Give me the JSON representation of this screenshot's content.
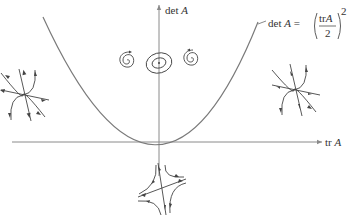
{
  "diagram": {
    "axes": {
      "horizontal_label": {
        "prefix": "tr",
        "var": "A"
      },
      "vertical_label": {
        "prefix": "det",
        "var": "A"
      }
    },
    "curve_label": {
      "lhs_prefix": "det",
      "lhs_var": "A",
      "equals": "=",
      "numerator_prefix": "tr",
      "numerator_var": "A",
      "denominator": "2",
      "exponent": "2"
    },
    "phase_portraits": [
      {
        "name": "node-unstable-left-region",
        "type": "node"
      },
      {
        "name": "spiral-left",
        "type": "spiral"
      },
      {
        "name": "center",
        "type": "center"
      },
      {
        "name": "spiral-right",
        "type": "spiral"
      },
      {
        "name": "node-right-region",
        "type": "node"
      },
      {
        "name": "saddle",
        "type": "saddle"
      }
    ],
    "colors": {
      "axis": "#8a8a8a",
      "curve": "#7a7a7a",
      "trajectory": "#444444",
      "text": "#333333",
      "background": "#ffffff"
    }
  }
}
